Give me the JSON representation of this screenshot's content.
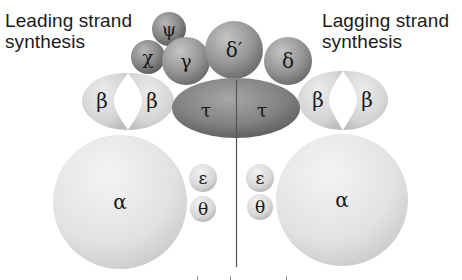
{
  "labels": {
    "leading": {
      "line1": "Leading strand",
      "line2": "synthesis"
    },
    "lagging": {
      "line1": "Lagging strand",
      "line2": "synthesis"
    }
  },
  "subunits": {
    "psi": "ψ",
    "chi": "χ",
    "gamma": "γ",
    "delta_prime": "δ′",
    "delta": "δ",
    "tau_left": "τ",
    "tau_right": "τ",
    "beta_left_1": "β",
    "beta_left_2": "β",
    "beta_right_1": "β",
    "beta_right_2": "β",
    "alpha_left": "α",
    "alpha_right": "α",
    "epsilon_left": "ε",
    "theta_left": "θ",
    "epsilon_right": "ε",
    "theta_right": "θ"
  },
  "colors": {
    "dark_subunit": "#8a8a8a",
    "tau": "#7d7d7d",
    "beta": "#d9d9d9",
    "alpha": "#e6e6e6",
    "small_core": "#dcdcdc",
    "line": "#555555"
  }
}
